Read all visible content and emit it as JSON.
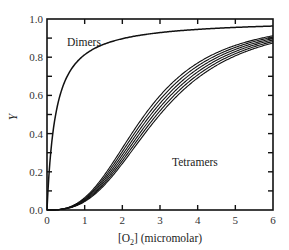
{
  "chart_data": {
    "type": "line",
    "title": "",
    "xlabel": "[O2] (micromolar)",
    "xlabel_main": "[O",
    "xlabel_sub": "2",
    "xlabel_rest": "] (micromolar)",
    "ylabel": "Y",
    "xlim": [
      0,
      6
    ],
    "ylim": [
      0,
      1.0
    ],
    "x_ticks": [
      0,
      1,
      2,
      3,
      4,
      5,
      6
    ],
    "x_tick_labels": [
      "0",
      "1",
      "2",
      "3",
      "4",
      "5",
      "6"
    ],
    "y_ticks": [
      0.0,
      0.2,
      0.4,
      0.6,
      0.8,
      1.0
    ],
    "y_tick_labels": [
      "0.0",
      "0.2",
      "0.4",
      "0.6",
      "0.8",
      "1.0"
    ],
    "grid": false,
    "legend": null,
    "annotations": [
      {
        "text": "Dimers",
        "x": 0.55,
        "y": 0.87
      },
      {
        "text": "Tetramers",
        "x": 3.1,
        "y": 0.27
      }
    ],
    "series": [
      {
        "name": "Dimers",
        "model": "hyperbolic",
        "K": 0.23,
        "x": [
          0,
          0.1,
          0.25,
          0.5,
          1,
          1.5,
          2,
          3,
          4,
          5,
          6
        ],
        "values": [
          0,
          0.3,
          0.52,
          0.68,
          0.81,
          0.87,
          0.9,
          0.93,
          0.95,
          0.96,
          0.96
        ]
      },
      {
        "name": "Tetramers",
        "model": "hill",
        "n": 2.8,
        "p50_values": [
          2.6,
          2.68,
          2.76,
          2.84,
          2.92,
          3.0
        ],
        "x": [
          0,
          1,
          2,
          3,
          4,
          5,
          6
        ],
        "values": [
          0,
          0.06,
          0.25,
          0.55,
          0.74,
          0.84,
          0.9
        ]
      }
    ]
  }
}
